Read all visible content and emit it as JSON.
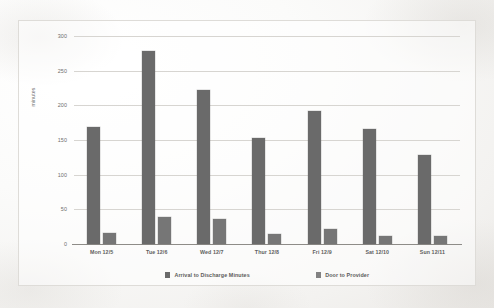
{
  "chart_data": {
    "type": "bar",
    "title": "",
    "xlabel": "",
    "ylabel": "minutes",
    "ylim": [
      0,
      300
    ],
    "yticks": [
      0,
      50,
      100,
      150,
      200,
      250,
      300
    ],
    "ytick_labels": [
      "0",
      "50",
      "100",
      "150",
      "200",
      "250",
      "300"
    ],
    "grid": true,
    "legend_position": "bottom",
    "categories": [
      "Mon 12/5",
      "Tue 12/6",
      "Wed 12/7",
      "Thur 12/8",
      "Fri 12/9",
      "Sat 12/10",
      "Sun 12/11"
    ],
    "series": [
      {
        "name": "Arrival to Discharge Minutes",
        "color": "#6a6a6a",
        "values": [
          169,
          278,
          222,
          153,
          192,
          166,
          128
        ]
      },
      {
        "name": "Door to Provider",
        "color": "#767676",
        "values": [
          16,
          39,
          36,
          15,
          21,
          12,
          11
        ]
      }
    ]
  }
}
